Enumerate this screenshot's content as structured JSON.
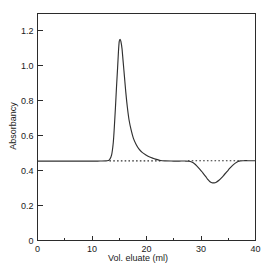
{
  "chart_data": {
    "type": "line",
    "title": "",
    "subtitle": "",
    "xlabel": "Vol. eluate (ml)",
    "ylabel": "Absorbancy",
    "xlim": [
      0,
      40
    ],
    "ylim": [
      0,
      1.3
    ],
    "grid": false,
    "legend": null,
    "x_ticks": [
      0,
      10,
      20,
      30,
      40
    ],
    "x_tick_labels": [
      "0",
      "10",
      "20",
      "30",
      "40"
    ],
    "x_minor_ticks": [
      5,
      15,
      25,
      35
    ],
    "y_ticks": [
      0,
      0.2,
      0.4,
      0.6,
      0.8,
      1.0,
      1.2
    ],
    "y_tick_labels": [
      "0",
      "0.2",
      "0.4",
      "0.6",
      "0.8",
      "1.0",
      "1.2"
    ],
    "baseline_value": 0.455,
    "peak": {
      "x": 15.0,
      "y": 1.15
    },
    "trough": {
      "x": 31.5,
      "y": 0.33
    },
    "series": [
      {
        "name": "elution trace",
        "style": "solid",
        "points": [
          [
            0.0,
            0.455
          ],
          [
            2.0,
            0.455
          ],
          [
            4.0,
            0.455
          ],
          [
            6.0,
            0.455
          ],
          [
            8.0,
            0.455
          ],
          [
            10.0,
            0.455
          ],
          [
            11.5,
            0.455
          ],
          [
            12.6,
            0.456
          ],
          [
            13.2,
            0.462
          ],
          [
            13.6,
            0.49
          ],
          [
            13.9,
            0.56
          ],
          [
            14.1,
            0.65
          ],
          [
            14.3,
            0.76
          ],
          [
            14.5,
            0.88
          ],
          [
            14.7,
            0.99
          ],
          [
            14.85,
            1.08
          ],
          [
            15.0,
            1.14
          ],
          [
            15.15,
            1.152
          ],
          [
            15.3,
            1.14
          ],
          [
            15.5,
            1.1
          ],
          [
            15.7,
            1.03
          ],
          [
            15.95,
            0.94
          ],
          [
            16.2,
            0.85
          ],
          [
            16.5,
            0.76
          ],
          [
            16.8,
            0.69
          ],
          [
            17.2,
            0.63
          ],
          [
            17.6,
            0.585
          ],
          [
            18.1,
            0.55
          ],
          [
            18.6,
            0.525
          ],
          [
            19.2,
            0.505
          ],
          [
            19.9,
            0.49
          ],
          [
            20.6,
            0.478
          ],
          [
            21.3,
            0.47
          ],
          [
            22.0,
            0.463
          ],
          [
            22.6,
            0.458
          ],
          [
            23.4,
            0.456
          ],
          [
            24.5,
            0.455
          ],
          [
            26.0,
            0.455
          ],
          [
            27.0,
            0.455
          ],
          [
            27.8,
            0.454
          ],
          [
            28.3,
            0.449
          ],
          [
            28.8,
            0.44
          ],
          [
            29.3,
            0.425
          ],
          [
            29.8,
            0.408
          ],
          [
            30.3,
            0.389
          ],
          [
            30.8,
            0.369
          ],
          [
            31.2,
            0.352
          ],
          [
            31.6,
            0.338
          ],
          [
            32.0,
            0.331
          ],
          [
            32.4,
            0.33
          ],
          [
            32.8,
            0.334
          ],
          [
            33.3,
            0.345
          ],
          [
            33.8,
            0.36
          ],
          [
            34.3,
            0.378
          ],
          [
            34.8,
            0.396
          ],
          [
            35.3,
            0.414
          ],
          [
            35.8,
            0.43
          ],
          [
            36.3,
            0.443
          ],
          [
            36.8,
            0.452
          ],
          [
            37.2,
            0.456
          ],
          [
            37.8,
            0.457
          ],
          [
            38.6,
            0.457
          ],
          [
            39.3,
            0.457
          ],
          [
            40.0,
            0.457
          ]
        ]
      }
    ],
    "baseline_segments": [
      {
        "style": "dotted",
        "x_start": 13.2,
        "x_end": 22.6,
        "y": 0.456
      },
      {
        "style": "dotted",
        "x_start": 27.6,
        "x_end": 37.2,
        "y": 0.457
      }
    ]
  }
}
